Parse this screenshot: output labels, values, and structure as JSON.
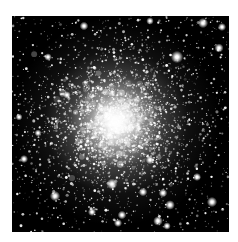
{
  "page": {
    "background": "#ffffff"
  },
  "image": {
    "type": "astronomy-photo",
    "subject": "globular-star-cluster",
    "background_color": "#000000",
    "star_color": "#ffffff",
    "frame": {
      "left": 12,
      "top": 16,
      "width": 217,
      "height": 216
    },
    "cluster": {
      "seed": 1337,
      "center_x_frac": 0.48,
      "center_y_frac": 0.49,
      "ellipticity_y": 0.94,
      "glows": [
        {
          "radius": 104,
          "alpha": 0.2
        },
        {
          "radius": 72,
          "alpha": 0.4
        },
        {
          "radius": 46,
          "alpha": 0.75
        },
        {
          "radius": 26,
          "alpha": 0.9
        }
      ],
      "mottle_count": 380,
      "mottle_sigma": 26,
      "star_count": 2900,
      "sigma_inner": 33,
      "sigma_outer": 64,
      "field_count": 620
    },
    "bright_stars": [
      [
        84,
        26,
        1.6
      ],
      [
        150,
        21,
        1.4
      ],
      [
        203,
        23,
        1.9
      ],
      [
        222,
        27,
        1.5
      ],
      [
        219,
        48,
        1.7
      ],
      [
        177,
        57,
        2.3
      ],
      [
        48,
        57,
        1.4
      ],
      [
        67,
        95,
        1.4
      ],
      [
        24,
        159,
        1.5
      ],
      [
        38,
        133,
        1.3
      ],
      [
        19,
        117,
        1.3
      ],
      [
        55,
        196,
        1.9
      ],
      [
        112,
        184,
        2.0
      ],
      [
        143,
        192,
        1.6
      ],
      [
        163,
        193,
        1.6
      ],
      [
        170,
        205,
        1.8
      ],
      [
        212,
        202,
        1.9
      ],
      [
        197,
        177,
        1.5
      ],
      [
        158,
        221,
        1.8
      ],
      [
        122,
        215,
        1.6
      ],
      [
        92,
        212,
        1.5
      ],
      [
        118,
        223,
        1.5
      ],
      [
        167,
        226,
        1.4
      ],
      [
        150,
        160,
        1.6
      ]
    ]
  }
}
